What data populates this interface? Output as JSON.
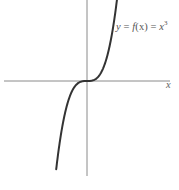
{
  "chart_data": {
    "type": "line",
    "title": "",
    "function": "y = f(x) = x^3",
    "annotation": {
      "lhs": "y",
      "eq1": " = ",
      "fname": "f",
      "arg": "(x)",
      "eq2": " = ",
      "base": "x",
      "exp": "3"
    },
    "xlabel": "x",
    "ylabel": "",
    "grid": false,
    "legend": "none",
    "axes": {
      "origin_px": [
        87,
        81
      ],
      "x_axis_span_px": [
        4,
        170
      ],
      "y_axis_span_px": [
        0,
        176
      ]
    },
    "series": [
      {
        "name": "y = x^3",
        "x": [
          -1.5,
          -1.25,
          -1.0,
          -0.75,
          -0.5,
          -0.25,
          0,
          0.25,
          0.5,
          0.75,
          1.0,
          1.25,
          1.5
        ],
        "values": [
          -3.375,
          -1.953,
          -1.0,
          -0.422,
          -0.125,
          -0.016,
          0,
          0.016,
          0.125,
          0.422,
          1.0,
          1.953,
          3.375
        ]
      }
    ],
    "colors": {
      "curve": "#333333",
      "axes": "#8a8a8a",
      "background": "#ffffff"
    }
  }
}
